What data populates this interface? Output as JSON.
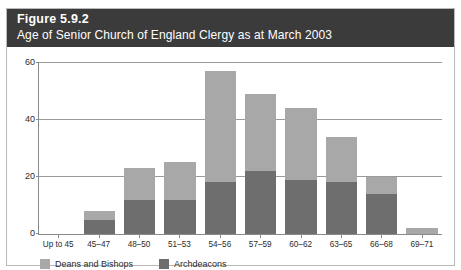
{
  "figure": {
    "number": "Figure 5.9.2",
    "title": "Age of Senior Church of England Clergy as at March 2003"
  },
  "colors": {
    "title_band": "#3b3b3b",
    "deans_and_bishops": "#a8a8a8",
    "archdeacons": "#6e6e6e",
    "grid": "#9a9a9a",
    "axis": "#8a8a8a"
  },
  "chart_data": {
    "type": "bar",
    "stacked": true,
    "title": "Age of Senior Church of England Clergy as at March 2003",
    "xlabel": "",
    "ylabel": "",
    "ylim": [
      0,
      60
    ],
    "yticks": [
      0,
      20,
      40,
      60
    ],
    "ytick_labels": [
      "0",
      "20",
      "40",
      "60"
    ],
    "grid": true,
    "legend_position": "bottom-left",
    "categories": [
      "Up to 45",
      "45–47",
      "48–50",
      "51–53",
      "54–56",
      "57–59",
      "60–62",
      "63–65",
      "66–68",
      "69–71"
    ],
    "series": [
      {
        "name": "Archdeacons",
        "color": "#6e6e6e",
        "values": [
          0,
          5,
          12,
          12,
          18,
          22,
          19,
          18,
          14,
          0
        ]
      },
      {
        "name": "Deans and Bishops",
        "color": "#a8a8a8",
        "values": [
          0,
          3,
          11,
          13,
          39,
          27,
          25,
          16,
          6,
          2
        ]
      }
    ],
    "totals": [
      0,
      8,
      23,
      25,
      57,
      49,
      44,
      34,
      20,
      2
    ]
  },
  "legend": [
    {
      "label": "Deans and Bishops",
      "color": "#a8a8a8",
      "swatch": "legend-swatch-deans"
    },
    {
      "label": "Archdeacons",
      "color": "#6e6e6e",
      "swatch": "legend-swatch-archdeacons"
    }
  ]
}
